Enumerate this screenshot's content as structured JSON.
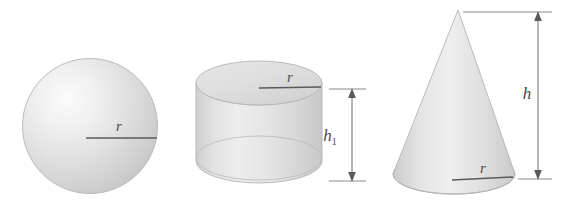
{
  "figure": {
    "background_color": "#ffffff",
    "width": 565,
    "height": 214,
    "shapes": [
      {
        "id": "sphere",
        "name": "sphere",
        "labels": [
          {
            "id": "sphere-radius",
            "text": "r",
            "subscript": "",
            "kind": "radius"
          }
        ]
      },
      {
        "id": "cylinder",
        "name": "cylinder",
        "labels": [
          {
            "id": "cylinder-radius",
            "text": "r",
            "subscript": "",
            "kind": "radius"
          },
          {
            "id": "cylinder-height",
            "text": "h",
            "subscript": "1",
            "kind": "height"
          }
        ]
      },
      {
        "id": "cone",
        "name": "cone",
        "labels": [
          {
            "id": "cone-radius",
            "text": "r",
            "subscript": "",
            "kind": "radius"
          },
          {
            "id": "cone-height",
            "text": "h",
            "subscript": "",
            "kind": "height"
          }
        ]
      }
    ]
  },
  "colors": {
    "label_text": "#4a4a4a",
    "dimension_line": "#6b6b6b",
    "radius_line": "#5a5a5a",
    "solid_fill_light": "#efefef",
    "solid_fill_mid": "#d9d9d9",
    "solid_fill_dark": "#c2c2c2",
    "outline": "#b4b4b4"
  }
}
